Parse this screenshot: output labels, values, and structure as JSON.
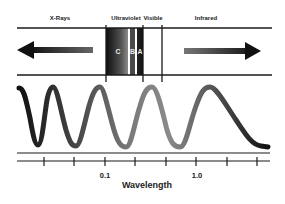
{
  "diagram": {
    "regions": [
      {
        "label": "X-Rays"
      },
      {
        "label": "Ultraviolet"
      },
      {
        "label": "Visible"
      },
      {
        "label": "Infrared"
      }
    ],
    "uv_bands": [
      {
        "label": "C"
      },
      {
        "label": "B"
      },
      {
        "label": "A"
      }
    ],
    "axis": {
      "title": "Wavelength",
      "tick_labels": [
        {
          "label": "0.1"
        },
        {
          "label": "1.0"
        }
      ],
      "tick_count": 8
    },
    "arrows": {
      "left": "arrow-left-icon",
      "right": "arrow-right-icon"
    },
    "colors": {
      "line": "#1a1a1a",
      "uv_dark": "#111111",
      "uv_light": "#777777"
    }
  }
}
